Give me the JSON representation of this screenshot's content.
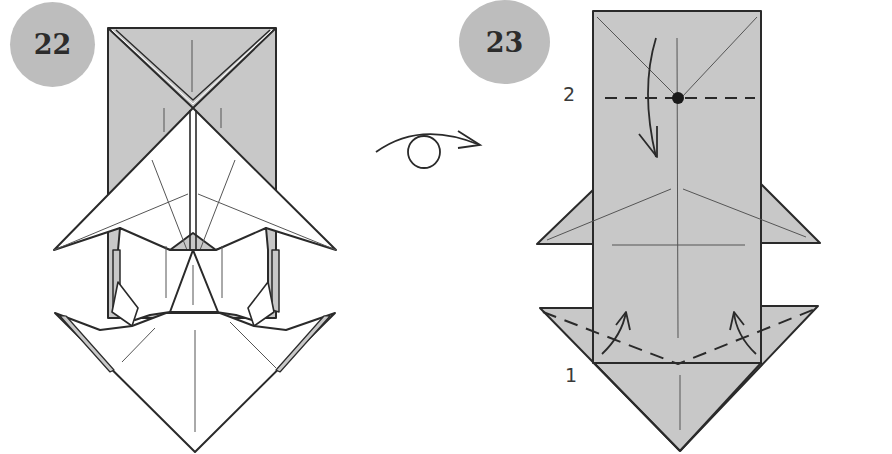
{
  "steps": [
    {
      "number": "22",
      "description": "Model before turning over"
    },
    {
      "number": "23",
      "description": "Model after turning over"
    }
  ],
  "symbols": {
    "turn_over": "turn-over-icon",
    "mountain_valley": "valley-fold-dashed-line",
    "fold_arrow": "fold-arrow-icon",
    "reference_point": "reference-dot"
  },
  "fold_labels": {
    "first": "1",
    "second": "2"
  },
  "colors": {
    "paper_colored": "#c8c8c8",
    "paper_white": "#ffffff",
    "badge": "#bdbdbd",
    "line": "#2a2a2a",
    "crease": "#555555"
  }
}
